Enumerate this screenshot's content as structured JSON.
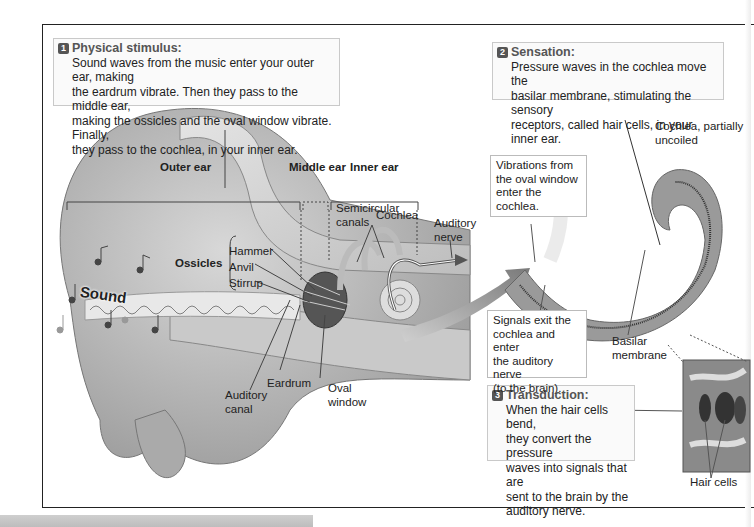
{
  "steps": [
    {
      "number": "1",
      "title": "Physical stimulus:",
      "lines": [
        "Sound waves from the music enter your outer ear, making",
        "the eardrum vibrate. Then they pass to the middle ear,",
        "making the ossicles and the oval window vibrate. Finally,",
        "they pass to the cochlea, in your inner ear."
      ]
    },
    {
      "number": "2",
      "title": "Sensation:",
      "lines": [
        "Pressure waves in the cochlea move the",
        "basilar membrane, stimulating the sensory",
        "receptors, called hair cells, in your inner ear."
      ]
    },
    {
      "number": "3",
      "title": "Transduction:",
      "lines": [
        "When the hair cells bend,",
        "they convert the pressure",
        "waves into signals that are",
        "sent to the brain by the",
        "auditory nerve."
      ]
    }
  ],
  "regions": {
    "outer_ear": "Outer ear",
    "middle_ear": "Middle ear",
    "inner_ear": "Inner ear"
  },
  "labels": {
    "sound": "Sound",
    "ossicles": "Ossicles",
    "hammer": "Hammer",
    "anvil": "Anvil",
    "stirrup": "Stirrup",
    "semicircular_1": "Semicircular",
    "semicircular_2": "canals",
    "cochlea": "Cochlea",
    "auditory_nerve_1": "Auditory",
    "auditory_nerve_2": "nerve",
    "eardrum": "Eardrum",
    "oval_window_1": "Oval",
    "oval_window_2": "window",
    "auditory_canal_1": "Auditory",
    "auditory_canal_2": "canal",
    "cochlea_uncoiled_1": "Cochlea, partially",
    "cochlea_uncoiled_2": "uncoiled",
    "basilar_1": "Basilar",
    "basilar_2": "membrane",
    "hair_cells": "Hair cells"
  },
  "callouts": {
    "vibrations": [
      "Vibrations from",
      "the oval window",
      "enter the cochlea."
    ],
    "signals": [
      "Signals exit the",
      "cochlea and enter",
      "the auditory nerve",
      "(to the brain)."
    ]
  }
}
